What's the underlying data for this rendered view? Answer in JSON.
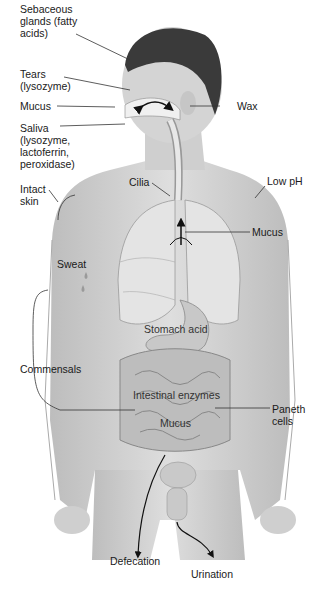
{
  "figure": {
    "type": "anatomical-diagram",
    "labels": {
      "sebaceous": "Sebaceous\nglands (fatty\nacids)",
      "tears": "Tears\n(lysozyme)",
      "mucus_nose": "Mucus",
      "saliva": "Saliva\n(lysozyme,\nlactoferrin,\nperoxidase)",
      "intact_skin": "Intact\nskin",
      "sweat": "Sweat",
      "commensals": "Commensals",
      "cilia": "Cilia",
      "wax": "Wax",
      "low_ph": "Low pH",
      "mucus_airway": "Mucus",
      "stomach_acid": "Stomach acid",
      "intestinal_enzymes": "Intestinal enzymes",
      "mucus_gut": "Mucus",
      "paneth": "Paneth\ncells",
      "defecation": "Defecation",
      "urination": "Urination"
    },
    "colors": {
      "skin": "#d8d8d8",
      "skin_shade": "#b9b9b9",
      "hair": "#3a3a3a",
      "organ": "#e4e4e4",
      "gut": "#c4c4c4",
      "leader_line": "#333333"
    }
  }
}
